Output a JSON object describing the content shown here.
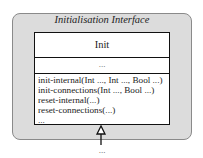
{
  "diagram": {
    "package_title": "Initialisation Interface",
    "class": {
      "name": "Init",
      "attributes": "...",
      "operations": [
        "init-internal(Int ..., Int ..., Bool ...)",
        "init-connections(Int ..., Bool ...)",
        "reset-internal(...)",
        "reset-connections(...)",
        "..."
      ]
    },
    "below_arrow_label": "...",
    "colors": {
      "package_fill": "#dcdcdc",
      "package_border": "#8a8a8a",
      "class_fill": "#ffffff",
      "class_border": "#111111"
    }
  }
}
